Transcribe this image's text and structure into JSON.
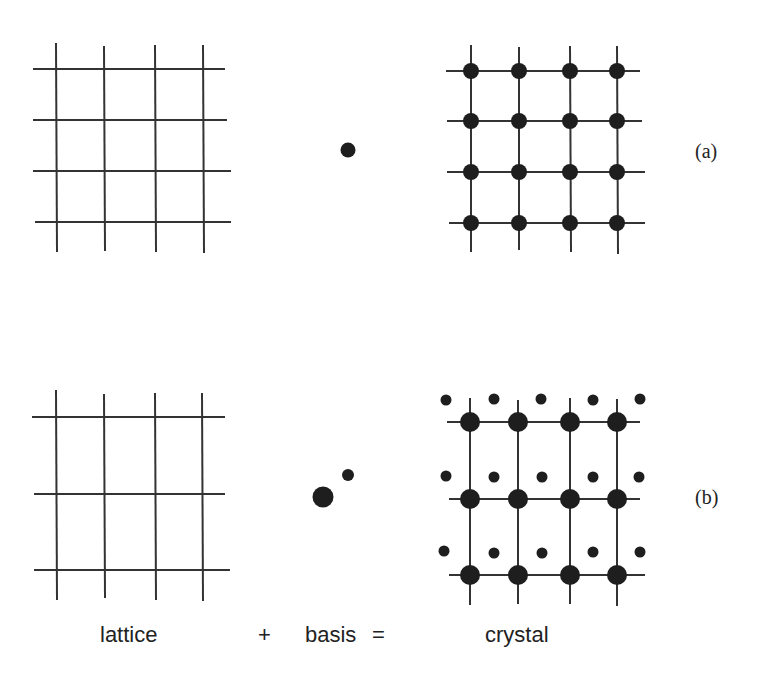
{
  "figure": {
    "rows": [
      {
        "label": "(a)",
        "lattice": {
          "rows": 4,
          "cols": 4
        },
        "basis": [
          {
            "size": "medium"
          }
        ],
        "crystal": {
          "rows": 4,
          "cols": 4,
          "atoms_per_site": 1
        }
      },
      {
        "label": "(b)",
        "lattice": {
          "rows": 3,
          "cols": 4
        },
        "basis": [
          {
            "size": "large"
          },
          {
            "size": "small"
          }
        ],
        "crystal": {
          "rows": 3,
          "cols": 4,
          "atoms_per_site": 2
        }
      }
    ],
    "captions": {
      "lattice": "lattice",
      "plus": "+",
      "basis": "basis",
      "equals": "=",
      "crystal": "crystal"
    },
    "colors": {
      "line": "#333333",
      "atom": "#1e1e1e",
      "text": "#222222"
    }
  }
}
